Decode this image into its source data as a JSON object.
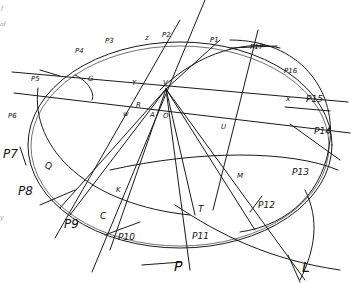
{
  "margin_fragments": [
    "f",
    "of",
    "y"
  ],
  "points": {
    "P1": "P1",
    "P2": "P2",
    "P3": "P3",
    "P4": "P4",
    "P5": "P5",
    "P6": "P6",
    "P7": "P7",
    "P8": "P8",
    "P9": "P9",
    "P10": "P10",
    "P11": "P11",
    "P12": "P12",
    "P13": "P13",
    "P14": "P14",
    "P15": "P15",
    "P16": "P16",
    "P17": "P17"
  },
  "letters": {
    "G": "G",
    "Y": "Y",
    "R": "R",
    "W": "w",
    "A": "A",
    "O": "O",
    "U": "U",
    "Q": "Q",
    "K": "K",
    "M": "M",
    "C": "C",
    "T": "T",
    "P": "P",
    "L": "L",
    "V": "V",
    "Z": "z",
    "B": "B",
    "X": "x",
    "S": "s",
    "H": "H"
  }
}
